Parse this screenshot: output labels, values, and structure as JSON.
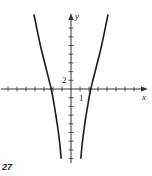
{
  "figure_label": "27",
  "chart_data": {
    "type": "line",
    "title": "",
    "xlabel": "x",
    "ylabel": "y",
    "x_tick_step": 1,
    "y_tick_step": 2,
    "tick_labels": [
      {
        "axis": "x",
        "value": 1,
        "text": "1"
      },
      {
        "axis": "y",
        "value": 2,
        "text": "2"
      }
    ],
    "xlim": [
      -7.7,
      8.3
    ],
    "ylim": [
      -18,
      19
    ],
    "grid": false,
    "legend": null,
    "series": [
      {
        "name": "left branch",
        "points": [
          [
            -4.1,
            17
          ],
          [
            -3.4,
            10
          ],
          [
            -2.8,
            5
          ],
          [
            -2.2,
            0
          ],
          [
            -1.8,
            -4.5
          ],
          [
            -1.5,
            -8.5
          ],
          [
            -1.25,
            -12.5
          ],
          [
            -1.1,
            -15.9
          ]
        ]
      },
      {
        "name": "right branch",
        "points": [
          [
            1.1,
            -15.9
          ],
          [
            1.25,
            -12.5
          ],
          [
            1.5,
            -8.5
          ],
          [
            1.8,
            -4.5
          ],
          [
            2.2,
            0
          ],
          [
            2.8,
            5
          ],
          [
            3.4,
            10
          ],
          [
            4.1,
            17
          ]
        ]
      }
    ]
  },
  "render": {
    "origin_px": [
      71,
      89
    ],
    "x_unit_px": 9,
    "y_unit_px": 4.35,
    "x_axis_px": [
      1,
      148
    ],
    "y_axis_px": [
      13,
      163
    ],
    "x_ticks": [
      -7,
      -6,
      -5,
      -4,
      -3,
      -2,
      -1,
      1,
      2,
      3,
      4,
      5,
      6,
      7
    ],
    "y_ticks": [
      -16,
      -14,
      -12,
      -10,
      -8,
      -6,
      -4,
      -2,
      2,
      4,
      6,
      8,
      10,
      12,
      14,
      16
    ],
    "colors": {
      "axis": "#333333",
      "curve": "#1a1a1a",
      "text": "#222222"
    }
  }
}
